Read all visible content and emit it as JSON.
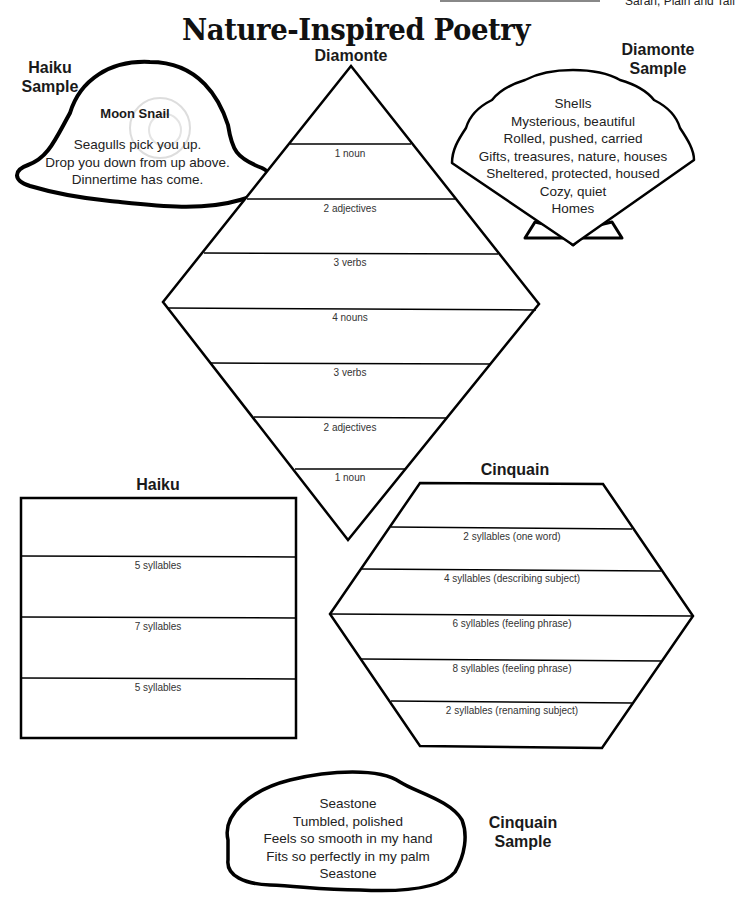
{
  "page": {
    "title": "Nature-Inspired Poetry",
    "top_reference": "Sarah, Plain and Tall"
  },
  "haiku_sample": {
    "heading_line1": "Haiku",
    "heading_line2": "Sample",
    "poem_title": "Moon Snail",
    "lines": [
      "Seagulls pick you up.",
      "Drop you down from up above.",
      "Dinnertime has come."
    ]
  },
  "diamonte_sample": {
    "heading_line1": "Diamonte",
    "heading_line2": "Sample",
    "lines": [
      "Shells",
      "Mysterious, beautiful",
      "Rolled, pushed, carried",
      "Gifts, treasures, nature, houses",
      "Sheltered, protected, housed",
      "Cozy, quiet",
      "Homes"
    ]
  },
  "diamonte_template": {
    "heading": "Diamonte",
    "rows": [
      "1 noun",
      "2 adjectives",
      "3 verbs",
      "4 nouns",
      "3 verbs",
      "2 adjectives",
      "1 noun"
    ]
  },
  "haiku_template": {
    "heading": "Haiku",
    "rows": [
      "5 syllables",
      "7 syllables",
      "5 syllables"
    ]
  },
  "cinquain_template": {
    "heading": "Cinquain",
    "rows": [
      "2 syllables (one word)",
      "4 syllables (describing subject)",
      "6 syllables (feeling phrase)",
      "8 syllables (feeling phrase)",
      "2 syllables (renaming subject)"
    ]
  },
  "cinquain_sample": {
    "heading_line1": "Cinquain",
    "heading_line2": "Sample",
    "lines": [
      "Seastone",
      "Tumbled, polished",
      "Feels so smooth in my hand",
      "Fits so perfectly in my palm",
      "Seastone"
    ]
  }
}
